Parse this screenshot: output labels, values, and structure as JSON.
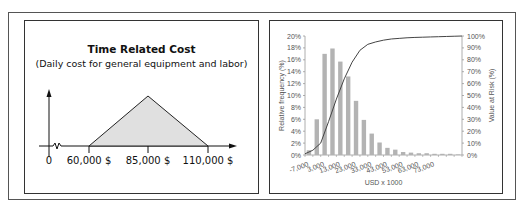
{
  "left_panel": {
    "title": "Time Related Cost",
    "subtitle": "(Daily cost for general equipment and labor)",
    "x_labels": [
      "0",
      "60,000 $",
      "85,000 $",
      "110,000 $"
    ],
    "distribution": {
      "type": "triangular",
      "min": 60000,
      "mode": 85000,
      "max": 110000
    },
    "fill_color": "#e0e0e0"
  },
  "chart_data": {
    "type": "bar",
    "title": "",
    "xlabel": "USD x 1000",
    "ylabel": "Relative frequency (%)",
    "y2label": "Value at Risk (%)",
    "ylim": [
      0,
      20
    ],
    "y2lim": [
      0,
      100
    ],
    "yticks": [
      "0%",
      "2%",
      "4%",
      "6%",
      "8%",
      "10%",
      "12%",
      "14%",
      "16%",
      "18%",
      "20%"
    ],
    "y2ticks": [
      "0%",
      "10%",
      "20%",
      "30%",
      "40%",
      "50%",
      "60%",
      "70%",
      "80%",
      "90%",
      "100%"
    ],
    "xticks": [
      "-7,000",
      "3,000",
      "13,000",
      "23,000",
      "33,000",
      "43,000",
      "53,000",
      "63,000",
      "73,000"
    ],
    "grid": false,
    "bar_color": "#b3b3b3",
    "line_color": "#444444",
    "series": [
      {
        "name": "Relative frequency",
        "type": "bar",
        "values": [
          0.8,
          6.0,
          17.0,
          17.9,
          15.7,
          13.2,
          9.1,
          5.9,
          3.6,
          2.1,
          1.2,
          0.9,
          0.5,
          0.4,
          0.3,
          0.3,
          0.2,
          0.2,
          0.2,
          0.1
        ]
      },
      {
        "name": "Value at Risk",
        "type": "line",
        "axis": "right",
        "values": [
          4,
          10,
          28,
          47,
          64,
          78,
          88,
          93,
          95,
          96.5,
          97.5,
          98,
          98.5,
          98.8,
          99,
          99.2,
          99.4,
          99.6,
          99.8,
          100
        ]
      }
    ]
  }
}
